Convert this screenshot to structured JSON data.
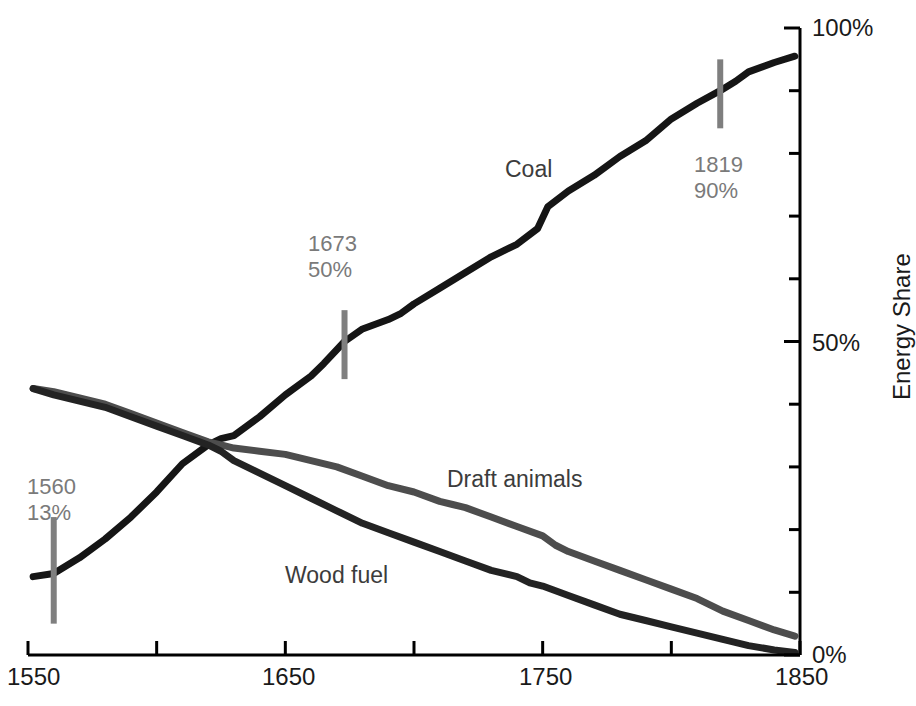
{
  "chart_data": {
    "type": "line",
    "title": "",
    "xlabel": "",
    "ylabel": "Energy Share",
    "xlim": [
      1550,
      1850
    ],
    "ylim": [
      0,
      100
    ],
    "grid": false,
    "legend_position": "inline-labels",
    "x_ticks_major": [
      1550,
      1650,
      1750,
      1850
    ],
    "x_ticks_minor": [
      1600,
      1700,
      1800
    ],
    "x_tick_labels": [
      "1550",
      "1650",
      "1750",
      "1850"
    ],
    "y_ticks_major": [
      0,
      50,
      100
    ],
    "y_tick_labels": [
      "0%",
      "50%",
      "100%"
    ],
    "y_ticks_minor": [
      10,
      20,
      30,
      40,
      60,
      70,
      80,
      90
    ],
    "series": [
      {
        "name": "Coal",
        "color": "#151515",
        "label_x": 1735,
        "label_y": 78,
        "x": [
          1552,
          1560,
          1570,
          1580,
          1590,
          1600,
          1610,
          1620,
          1625,
          1630,
          1640,
          1650,
          1660,
          1665,
          1673,
          1680,
          1690,
          1695,
          1700,
          1710,
          1720,
          1730,
          1740,
          1748,
          1752,
          1760,
          1770,
          1780,
          1790,
          1800,
          1810,
          1819,
          1825,
          1830,
          1840,
          1848
        ],
        "y": [
          12.5,
          13,
          15.5,
          18.5,
          22,
          26,
          30.5,
          33.5,
          34.5,
          35,
          38,
          41.5,
          44.5,
          46.5,
          50,
          52,
          53.5,
          54.5,
          56,
          58.5,
          61,
          63.5,
          65.5,
          68,
          71.5,
          74,
          76.5,
          79.5,
          82,
          85.5,
          88,
          90,
          91.5,
          93,
          94.5,
          95.5
        ]
      },
      {
        "name": "Draft animals",
        "color": "#4d4d4d",
        "label_x": 1722,
        "label_y": 29,
        "x": [
          1552,
          1560,
          1570,
          1580,
          1590,
          1600,
          1610,
          1620,
          1625,
          1630,
          1640,
          1650,
          1660,
          1670,
          1680,
          1690,
          1700,
          1710,
          1715,
          1720,
          1730,
          1740,
          1750,
          1755,
          1760,
          1770,
          1780,
          1790,
          1800,
          1810,
          1820,
          1830,
          1840,
          1848
        ],
        "y": [
          42.5,
          42,
          41,
          40,
          38.5,
          37,
          35.5,
          34,
          33.5,
          33,
          32.5,
          32,
          31,
          30,
          28.5,
          27,
          26,
          24.5,
          24,
          23.5,
          22,
          20.5,
          19,
          17.5,
          16.5,
          15,
          13.5,
          12,
          10.5,
          9,
          7,
          5.5,
          4,
          3
        ]
      },
      {
        "name": "Wood fuel",
        "color": "#232323",
        "label_x": 1675,
        "label_y": 13,
        "x": [
          1552,
          1560,
          1570,
          1580,
          1590,
          1600,
          1610,
          1620,
          1625,
          1630,
          1640,
          1650,
          1660,
          1670,
          1680,
          1690,
          1700,
          1710,
          1720,
          1730,
          1740,
          1745,
          1750,
          1760,
          1770,
          1780,
          1790,
          1800,
          1810,
          1820,
          1830,
          1840,
          1848
        ],
        "y": [
          42.5,
          41.5,
          40.5,
          39.5,
          38,
          36.5,
          35,
          33.5,
          32.5,
          31,
          29,
          27,
          25,
          23,
          21,
          19.5,
          18,
          16.5,
          15,
          13.5,
          12.5,
          11.5,
          11,
          9.5,
          8,
          6.5,
          5.5,
          4.5,
          3.5,
          2.5,
          1.5,
          0.8,
          0.4
        ]
      }
    ],
    "annotations": [
      {
        "id": "annot-1560",
        "year": "1560",
        "value": "13%",
        "year_num": 1560,
        "value_num": 13,
        "marker_low": 5,
        "marker_high": 22
      },
      {
        "id": "annot-1673",
        "year": "1673",
        "value": "50%",
        "year_num": 1673,
        "value_num": 50,
        "marker_low": 44,
        "marker_high": 55
      },
      {
        "id": "annot-1819",
        "year": "1819",
        "value": "90%",
        "year_num": 1819,
        "value_num": 90,
        "marker_low": 84,
        "marker_high": 95
      }
    ],
    "annotation_marker_color": "#7f7f7f",
    "axis_color": "#000000"
  },
  "axes": {
    "y_axis_title": "Energy Share",
    "x_tick_labels": [
      "1550",
      "1650",
      "1750",
      "1850"
    ],
    "y_tick_labels": [
      "0%",
      "50%",
      "100%"
    ]
  },
  "labels": {
    "coal": "Coal",
    "draft_animals": "Draft animals",
    "wood_fuel": "Wood fuel"
  },
  "annotations_text": {
    "a1_year": "1560",
    "a1_value": "13%",
    "a2_year": "1673",
    "a2_value": "50%",
    "a3_year": "1819",
    "a3_value": "90%"
  }
}
